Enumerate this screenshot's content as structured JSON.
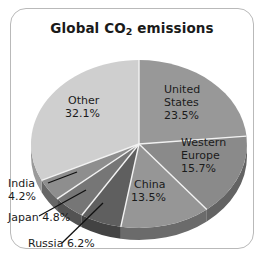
{
  "figure": {
    "title_main": "Global CO",
    "title_sub": "2",
    "title_tail": " emissions",
    "title_full": "Global CO2 emissions",
    "frame_color": "#b9b9b9",
    "background": "#ffffff"
  },
  "chart_data": {
    "type": "pie",
    "title": "Global CO2 emissions",
    "xlabel": "",
    "ylabel": "",
    "units": "percent",
    "total": 100.0,
    "legend": "none",
    "labels_inside": [
      "United States",
      "Western Europe",
      "China",
      "Other"
    ],
    "labels_outside": [
      "Russia",
      "Japan",
      "India"
    ],
    "categories": [
      "United States",
      "Western Europe",
      "China",
      "Russia",
      "Japan",
      "India",
      "Other"
    ],
    "values": [
      23.5,
      15.7,
      13.5,
      6.2,
      4.8,
      4.2,
      32.1
    ],
    "slices": [
      {
        "name": "United States",
        "label": "United States",
        "line1": "United",
        "line2": "States",
        "value": 23.5,
        "value_text": "23.5%",
        "color": "#989898",
        "side_color": "#6e6e6e",
        "label_placement": "inside",
        "start_deg": 0.0,
        "end_deg": 84.6
      },
      {
        "name": "Western Europe",
        "label": "Western Europe",
        "line1": "Western",
        "line2": "Europe",
        "value": 15.7,
        "value_text": "15.7%",
        "color": "#8a8a8a",
        "side_color": "#636363",
        "label_placement": "inside",
        "start_deg": 84.6,
        "end_deg": 141.1
      },
      {
        "name": "China",
        "label": "China",
        "line1": "China",
        "line2": "",
        "value": 13.5,
        "value_text": "13.5%",
        "color": "#969696",
        "side_color": "#6b6b6b",
        "label_placement": "inside",
        "start_deg": 141.1,
        "end_deg": 189.7
      },
      {
        "name": "Russia",
        "label": "Russia",
        "line1": "Russia 6.2%",
        "line2": "",
        "value": 6.2,
        "value_text": "6.2%",
        "color": "#5f5f5f",
        "side_color": "#434343",
        "label_placement": "outside",
        "start_deg": 189.7,
        "end_deg": 212.0
      },
      {
        "name": "Japan",
        "label": "Japan",
        "line1": "Japan 4.8%",
        "line2": "",
        "value": 4.8,
        "value_text": "4.8%",
        "color": "#767676",
        "side_color": "#535353",
        "label_placement": "outside",
        "start_deg": 212.0,
        "end_deg": 229.3
      },
      {
        "name": "India",
        "label": "India",
        "line1": "India",
        "line2": "4.2%",
        "value": 4.2,
        "value_text": "4.2%",
        "color": "#8e8e8e",
        "side_color": "#666666",
        "label_placement": "outside",
        "start_deg": 229.3,
        "end_deg": 244.4
      },
      {
        "name": "Other",
        "label": "Other",
        "line1": "Other",
        "line2": "",
        "value": 32.1,
        "value_text": "32.1%",
        "color": "#cfcfcf",
        "side_color": "#9a9a9a",
        "label_placement": "inside",
        "start_deg": 244.4,
        "end_deg": 360.0
      }
    ]
  },
  "labels": {
    "us_l1": "United",
    "us_l2": "States",
    "us_pct": "23.5%",
    "we_l1": "Western",
    "we_l2": "Europe",
    "we_pct": "15.7%",
    "cn_l1": "China",
    "cn_pct": "13.5%",
    "other_l1": "Other",
    "other_pct": "32.1%",
    "india_l1": "India",
    "india_pct": "4.2%",
    "japan_line": "Japan 4.8%",
    "russia_line": "Russia 6.2%"
  }
}
